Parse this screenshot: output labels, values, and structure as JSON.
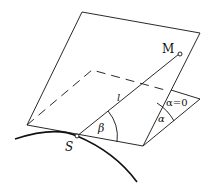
{
  "diagram": {
    "labels": {
      "M": "M",
      "S": "S",
      "l": "l",
      "beta": "β",
      "alpha": "α",
      "alpha_zero": "α=0"
    },
    "colors": {
      "stroke": "#111111",
      "background": "#ffffff"
    }
  }
}
